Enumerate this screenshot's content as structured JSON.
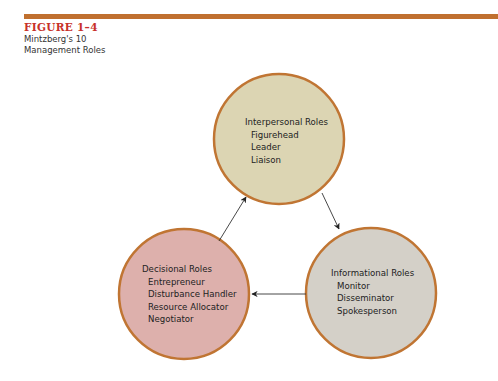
{
  "figure": {
    "label": "FIGURE 1–4",
    "caption_line1": "Mintzberg's 10",
    "caption_line2": "Management Roles"
  },
  "colors": {
    "rule": "#c0702f",
    "figure_label": "#c8312a",
    "circle_stroke": "#c07533",
    "interpersonal_fill": "#dcd5b3",
    "informational_fill": "#d4d0c8",
    "decisional_fill": "#ddb0ac",
    "arrow": "#333333"
  },
  "roles": {
    "interpersonal": {
      "title": "Interpersonal Roles",
      "items": [
        "Figurehead",
        "Leader",
        "Liaison"
      ]
    },
    "informational": {
      "title": "Informational Roles",
      "items": [
        "Monitor",
        "Disseminator",
        "Spokesperson"
      ]
    },
    "decisional": {
      "title": "Decisional Roles",
      "items": [
        "Entrepreneur",
        "Disturbance Handler",
        "Resource Allocator",
        "Negotiator"
      ]
    }
  },
  "flows": [
    {
      "from": "interpersonal",
      "to": "informational"
    },
    {
      "from": "informational",
      "to": "decisional"
    },
    {
      "from": "decisional",
      "to": "interpersonal"
    }
  ]
}
